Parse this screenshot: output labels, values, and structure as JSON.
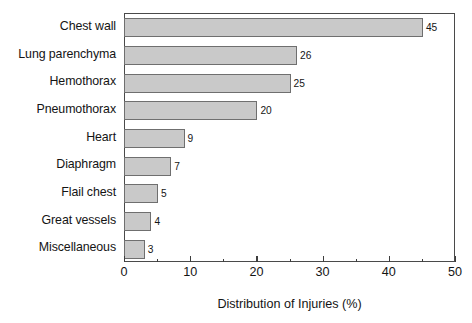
{
  "chart_data": {
    "type": "bar",
    "orientation": "horizontal",
    "title": "",
    "xlabel": "Distribution of Injuries (%)",
    "ylabel": "",
    "categories": [
      "Chest wall",
      "Lung parenchyma",
      "Hemothorax",
      "Pneumothorax",
      "Heart",
      "Diaphragm",
      "Flail chest",
      "Great vessels",
      "Miscellaneous"
    ],
    "values": [
      45,
      26,
      25,
      20,
      9,
      7,
      5,
      4,
      3
    ],
    "data_labels": [
      "45",
      "26",
      "25",
      "20",
      "9",
      "7",
      "5",
      "4",
      "3"
    ],
    "xlim": [
      0,
      50
    ],
    "xticks": [
      0,
      10,
      20,
      30,
      40,
      50
    ],
    "xtick_labels": [
      "0",
      "10",
      "20",
      "30",
      "40",
      "50"
    ],
    "xminor_ticks": [
      5,
      15,
      25,
      35,
      45
    ],
    "grid": false,
    "legend": false,
    "legend_position": "none",
    "bar_fill_color": "#c9c9c9",
    "bar_edge_color": "#6f6f6f",
    "frame_color": "#4a4a4a",
    "background_color": "#ffffff",
    "text_color": "#141414"
  }
}
